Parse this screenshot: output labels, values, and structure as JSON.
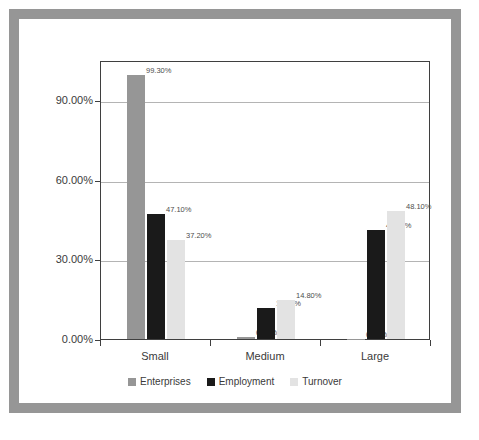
{
  "figure": {
    "frame_color": "#969696",
    "background": "#ffffff"
  },
  "chart_data": {
    "type": "bar",
    "title": "",
    "subtitle": "",
    "xlabel": "",
    "ylabel": "",
    "categories": [
      "Small",
      "Medium",
      "Large"
    ],
    "series": [
      {
        "name": "Enterprises",
        "color": "#969696",
        "values": [
          99.3,
          0.6,
          0.1
        ],
        "labels": [
          "99.30%",
          "0.60%",
          "0.10%"
        ]
      },
      {
        "name": "Employment",
        "color": "#1a1a1a",
        "values": [
          47.1,
          11.7,
          41.1
        ],
        "labels": [
          "47.10%",
          "11.70%",
          "41.10%"
        ]
      },
      {
        "name": "Turnover",
        "color": "#e3e3e3",
        "values": [
          37.2,
          14.8,
          48.1
        ],
        "labels": [
          "37.20%",
          "14.80%",
          "48.10%"
        ]
      }
    ],
    "ylim": [
      0,
      105
    ],
    "yticks": [
      0,
      30,
      60,
      90
    ],
    "ytick_labels": [
      "0.00%",
      "30.00%",
      "60.00%",
      "90.00%"
    ],
    "grid": true,
    "legend_position": "bottom",
    "axis_color": "#3f3f3f",
    "grid_color": "#b4b4b4"
  },
  "legend": {
    "items": [
      {
        "label": "Enterprises",
        "color": "#969696"
      },
      {
        "label": "Employment",
        "color": "#1a1a1a"
      },
      {
        "label": "Turnover",
        "color": "#e3e3e3"
      }
    ]
  }
}
